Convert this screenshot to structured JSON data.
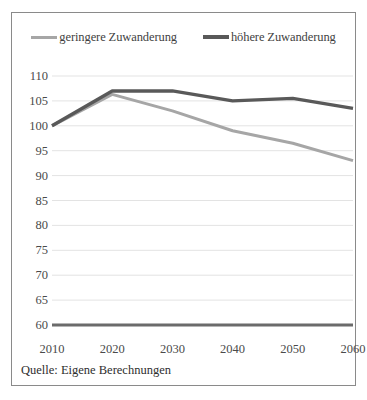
{
  "figure": {
    "source_note": "Quelle: Eigene Berechnungen",
    "background_color": "#ffffff",
    "border_color": "#8a8a8a"
  },
  "legend": {
    "position": "top-center",
    "entries": [
      {
        "label": "geringere Zuwanderung",
        "color": "#a6a6a6",
        "swatch": "line-swatch"
      },
      {
        "label": "höhere Zuwanderung",
        "color": "#595959",
        "swatch": "line-swatch"
      }
    ]
  },
  "chart_data": {
    "type": "line",
    "title": "",
    "subtitle": "",
    "xlabel": "",
    "ylabel": "",
    "categories": [
      "2010",
      "2020",
      "2030",
      "2040",
      "2050",
      "2060"
    ],
    "x": [
      2010,
      2020,
      2030,
      2040,
      2050,
      2060
    ],
    "xlim": [
      2010,
      2060
    ],
    "ylim": [
      60,
      110
    ],
    "yticks": [
      60,
      65,
      70,
      75,
      80,
      85,
      90,
      95,
      100,
      105,
      110
    ],
    "ytick_labels": [
      "60",
      "65",
      "70",
      "75",
      "80",
      "85",
      "90",
      "95",
      "100",
      "105",
      "110"
    ],
    "xtick_labels": [
      "2010",
      "2020",
      "2030",
      "2040",
      "2050",
      "2060"
    ],
    "grid": "horizontal",
    "grid_color": "#e3e3e3",
    "legend_position": "top-center",
    "series": [
      {
        "name": "geringere Zuwanderung",
        "color": "#a6a6a6",
        "width": 3,
        "values": [
          100,
          106.3,
          103,
          99,
          96.5,
          93
        ]
      },
      {
        "name": "höhere Zuwanderung",
        "color": "#595959",
        "width": 3.4,
        "values": [
          100,
          107,
          107,
          105,
          105.5,
          103.5
        ]
      },
      {
        "name": "baseline",
        "color": "#6b6b6b",
        "width": 3.2,
        "values": [
          60,
          60,
          60,
          60,
          60,
          60
        ]
      }
    ]
  }
}
